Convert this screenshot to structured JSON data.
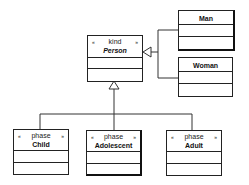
{
  "diagram": {
    "type": "uml-class-diagram",
    "classes": {
      "person": {
        "stereotype": "kind",
        "name": "Person",
        "guillemet_open": "«",
        "guillemet_close": "»"
      },
      "man": {
        "name": "Man"
      },
      "woman": {
        "name": "Woman"
      },
      "child": {
        "stereotype": "phase",
        "name": "Child",
        "guillemet_open": "«",
        "guillemet_close": "»"
      },
      "adolescent": {
        "stereotype": "phase",
        "name": "Adolescent",
        "guillemet_open": "«",
        "guillemet_close": "»"
      },
      "adult": {
        "stereotype": "phase",
        "name": "Adult",
        "guillemet_open": "«",
        "guillemet_close": "»"
      }
    },
    "relations": [
      {
        "type": "generalization",
        "from": "Man",
        "to": "Person"
      },
      {
        "type": "generalization",
        "from": "Woman",
        "to": "Person"
      },
      {
        "type": "generalization",
        "from": "Child",
        "to": "Person"
      },
      {
        "type": "generalization",
        "from": "Adolescent",
        "to": "Person"
      },
      {
        "type": "generalization",
        "from": "Adult",
        "to": "Person"
      }
    ],
    "line_color": "#222222"
  }
}
